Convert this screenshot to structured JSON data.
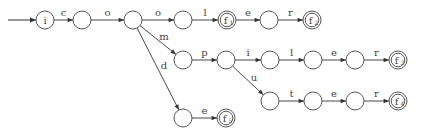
{
  "diagram": {
    "type": "trie-automaton",
    "nodes": [
      {
        "id": "n0",
        "x": 45,
        "y": 20,
        "label": "i",
        "final": false
      },
      {
        "id": "n1",
        "x": 82,
        "y": 20,
        "label": "",
        "final": false
      },
      {
        "id": "n2",
        "x": 133,
        "y": 20,
        "label": "",
        "final": false
      },
      {
        "id": "n3",
        "x": 183,
        "y": 20,
        "label": "",
        "final": false
      },
      {
        "id": "n4",
        "x": 227,
        "y": 20,
        "label": "f",
        "sub": "1",
        "final": true
      },
      {
        "id": "n5",
        "x": 269,
        "y": 20,
        "label": "",
        "final": false
      },
      {
        "id": "n6",
        "x": 312,
        "y": 20,
        "label": "f",
        "sub": "2",
        "final": true
      },
      {
        "id": "n7",
        "x": 183,
        "y": 60,
        "label": "",
        "final": false
      },
      {
        "id": "n8",
        "x": 226,
        "y": 60,
        "label": "",
        "final": false
      },
      {
        "id": "n9",
        "x": 270,
        "y": 60,
        "label": "",
        "final": false
      },
      {
        "id": "n10",
        "x": 313,
        "y": 60,
        "label": "",
        "final": false
      },
      {
        "id": "n11",
        "x": 355,
        "y": 60,
        "label": "",
        "final": false
      },
      {
        "id": "n12",
        "x": 398,
        "y": 60,
        "label": "f",
        "sub": "3",
        "final": true
      },
      {
        "id": "n13",
        "x": 270,
        "y": 101,
        "label": "",
        "final": false
      },
      {
        "id": "n14",
        "x": 313,
        "y": 101,
        "label": "",
        "final": false
      },
      {
        "id": "n15",
        "x": 355,
        "y": 101,
        "label": "",
        "final": false
      },
      {
        "id": "n16",
        "x": 398,
        "y": 101,
        "label": "f",
        "sub": "4",
        "final": true
      },
      {
        "id": "n17",
        "x": 183,
        "y": 118,
        "label": "",
        "final": false
      },
      {
        "id": "n18",
        "x": 226,
        "y": 118,
        "label": "f",
        "sub": "5",
        "final": true
      }
    ],
    "edges": [
      {
        "from": "n0",
        "to": "n1",
        "label": "c"
      },
      {
        "from": "n1",
        "to": "n2",
        "label": "o"
      },
      {
        "from": "n2",
        "to": "n3",
        "label": "o"
      },
      {
        "from": "n3",
        "to": "n4",
        "label": "l"
      },
      {
        "from": "n4",
        "to": "n5",
        "label": "e"
      },
      {
        "from": "n5",
        "to": "n6",
        "label": "r"
      },
      {
        "from": "n2",
        "to": "n7",
        "label": "m"
      },
      {
        "from": "n7",
        "to": "n8",
        "label": "p"
      },
      {
        "from": "n8",
        "to": "n9",
        "label": "i"
      },
      {
        "from": "n9",
        "to": "n10",
        "label": "l"
      },
      {
        "from": "n10",
        "to": "n11",
        "label": "e"
      },
      {
        "from": "n11",
        "to": "n12",
        "label": "r"
      },
      {
        "from": "n8",
        "to": "n13",
        "label": "u"
      },
      {
        "from": "n13",
        "to": "n14",
        "label": "t"
      },
      {
        "from": "n14",
        "to": "n15",
        "label": "e"
      },
      {
        "from": "n15",
        "to": "n16",
        "label": "r"
      },
      {
        "from": "n2",
        "to": "n17",
        "label": "d"
      },
      {
        "from": "n17",
        "to": "n18",
        "label": "e"
      }
    ],
    "start_arrow": {
      "from_x": 8,
      "to": "n0"
    }
  }
}
